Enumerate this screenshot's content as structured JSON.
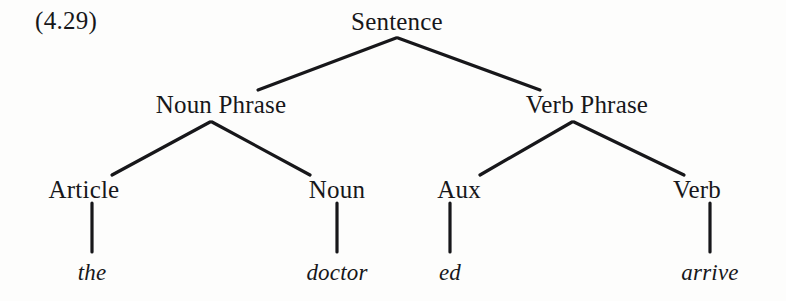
{
  "figure": {
    "number_label": "(4.29)",
    "background_color": "#fdfdfc",
    "ink_color": "#17171a",
    "caption": ""
  },
  "tree": {
    "root": "Sentence",
    "nodes": [
      {
        "id": "sentence",
        "label": "Sentence",
        "kind": "nonterminal",
        "x": 397,
        "y": 21
      },
      {
        "id": "noun-phrase",
        "label": "Noun Phrase",
        "kind": "nonterminal",
        "x": 221,
        "y": 104
      },
      {
        "id": "verb-phrase",
        "label": "Verb Phrase",
        "kind": "nonterminal",
        "x": 587,
        "y": 104
      },
      {
        "id": "article",
        "label": "Article",
        "kind": "nonterminal",
        "x": 84,
        "y": 189
      },
      {
        "id": "noun",
        "label": "Noun",
        "kind": "nonterminal",
        "x": 337,
        "y": 189
      },
      {
        "id": "aux",
        "label": "Aux",
        "kind": "nonterminal",
        "x": 459,
        "y": 189
      },
      {
        "id": "verb",
        "label": "Verb",
        "kind": "nonterminal",
        "x": 697,
        "y": 189
      },
      {
        "id": "the",
        "label": "the",
        "kind": "terminal",
        "x": 92,
        "y": 272
      },
      {
        "id": "doctor",
        "label": "doctor",
        "kind": "terminal",
        "x": 337,
        "y": 272
      },
      {
        "id": "ed",
        "label": "ed",
        "kind": "terminal",
        "x": 450,
        "y": 272
      },
      {
        "id": "arrive",
        "label": "arrive",
        "kind": "terminal",
        "x": 710,
        "y": 272
      }
    ],
    "edges": [
      {
        "from": "sentence",
        "to": "noun-phrase",
        "x1": 396,
        "y1": 38,
        "x2": 258,
        "y2": 90
      },
      {
        "from": "sentence",
        "to": "verb-phrase",
        "x1": 398,
        "y1": 38,
        "x2": 540,
        "y2": 90
      },
      {
        "from": "noun-phrase",
        "to": "article",
        "x1": 210,
        "y1": 122,
        "x2": 112,
        "y2": 175
      },
      {
        "from": "noun-phrase",
        "to": "noun",
        "x1": 212,
        "y1": 122,
        "x2": 310,
        "y2": 175
      },
      {
        "from": "verb-phrase",
        "to": "aux",
        "x1": 572,
        "y1": 122,
        "x2": 480,
        "y2": 175
      },
      {
        "from": "verb-phrase",
        "to": "verb",
        "x1": 574,
        "y1": 122,
        "x2": 684,
        "y2": 175
      },
      {
        "from": "article",
        "to": "the",
        "x1": 92,
        "y1": 203,
        "x2": 92,
        "y2": 252
      },
      {
        "from": "noun",
        "to": "doctor",
        "x1": 337,
        "y1": 203,
        "x2": 337,
        "y2": 252
      },
      {
        "from": "aux",
        "to": "ed",
        "x1": 450,
        "y1": 203,
        "x2": 450,
        "y2": 252
      },
      {
        "from": "verb",
        "to": "arrive",
        "x1": 710,
        "y1": 203,
        "x2": 710,
        "y2": 252
      }
    ],
    "sentence_text": "the doctor ed arrive"
  }
}
